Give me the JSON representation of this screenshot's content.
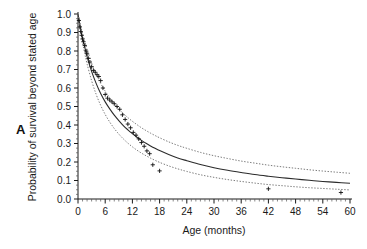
{
  "figure": {
    "panel_label": "A",
    "background_color": "#ffffff",
    "ink_color": "#1a1a1a"
  },
  "chart_data": {
    "type": "line",
    "title": "",
    "xlabel": "Age (months)",
    "ylabel": "Probability of survival beyond stated age",
    "xlim": [
      0,
      60
    ],
    "ylim": [
      0.0,
      1.0
    ],
    "grid": false,
    "legend_position": "none",
    "xticks": [
      0,
      6,
      12,
      18,
      24,
      30,
      36,
      42,
      48,
      54,
      60
    ],
    "xticklabels": [
      "0",
      "6",
      "12",
      "18",
      "24",
      "30",
      "36",
      "42",
      "48",
      "54",
      "60"
    ],
    "yticks": [
      0.0,
      0.1,
      0.2,
      0.3,
      0.4,
      0.5,
      0.6,
      0.7,
      0.8,
      0.9,
      1.0
    ],
    "yticklabels": [
      "0.0",
      "0.1",
      "0.2",
      "0.3",
      "0.4",
      "0.5",
      "0.6",
      "0.7",
      "0.8",
      "0.9",
      "1.0"
    ],
    "xtick_minor_step": 1,
    "series": [
      {
        "name": "Fitted survival function",
        "style": "solid",
        "color": "#2b2b2b",
        "x": [
          0,
          0.5,
          1,
          1.5,
          2,
          3,
          4,
          5,
          6,
          7,
          8,
          9,
          10,
          11,
          12,
          13,
          14,
          15,
          16,
          17,
          18,
          20,
          22,
          24,
          27,
          30,
          33,
          36,
          39,
          42,
          45,
          48,
          51,
          54,
          57,
          60
        ],
        "y": [
          1.0,
          0.93,
          0.87,
          0.82,
          0.77,
          0.69,
          0.625,
          0.57,
          0.525,
          0.487,
          0.453,
          0.424,
          0.397,
          0.374,
          0.353,
          0.334,
          0.317,
          0.301,
          0.287,
          0.274,
          0.262,
          0.241,
          0.222,
          0.207,
          0.186,
          0.169,
          0.155,
          0.143,
          0.132,
          0.123,
          0.115,
          0.108,
          0.101,
          0.095,
          0.09,
          0.085
        ]
      },
      {
        "name": "Upper 95% confidence limit",
        "style": "dotted",
        "color": "#6b6b6b",
        "x": [
          0,
          0.5,
          1,
          1.5,
          2,
          3,
          4,
          5,
          6,
          7,
          8,
          9,
          10,
          11,
          12,
          13,
          14,
          15,
          16,
          17,
          18,
          20,
          22,
          24,
          27,
          30,
          33,
          36,
          39,
          42,
          45,
          48,
          51,
          54,
          57,
          60
        ],
        "y": [
          1.0,
          0.945,
          0.895,
          0.85,
          0.81,
          0.735,
          0.675,
          0.625,
          0.583,
          0.547,
          0.515,
          0.487,
          0.462,
          0.44,
          0.42,
          0.402,
          0.385,
          0.37,
          0.356,
          0.343,
          0.331,
          0.309,
          0.29,
          0.274,
          0.252,
          0.234,
          0.219,
          0.205,
          0.194,
          0.183,
          0.174,
          0.166,
          0.158,
          0.151,
          0.145,
          0.139
        ]
      },
      {
        "name": "Lower 95% confidence limit",
        "style": "dotted",
        "color": "#6b6b6b",
        "x": [
          0,
          0.5,
          1,
          1.5,
          2,
          3,
          4,
          5,
          6,
          7,
          8,
          9,
          10,
          11,
          12,
          13,
          14,
          15,
          16,
          17,
          18,
          20,
          22,
          24,
          27,
          30,
          33,
          36,
          39,
          42,
          45,
          48,
          51,
          54,
          57,
          60
        ],
        "y": [
          1.0,
          0.915,
          0.845,
          0.785,
          0.73,
          0.64,
          0.566,
          0.506,
          0.457,
          0.416,
          0.381,
          0.351,
          0.325,
          0.302,
          0.282,
          0.264,
          0.248,
          0.234,
          0.221,
          0.209,
          0.198,
          0.179,
          0.163,
          0.149,
          0.131,
          0.117,
          0.105,
          0.095,
          0.086,
          0.078,
          0.072,
          0.066,
          0.061,
          0.057,
          0.053,
          0.049
        ]
      }
    ],
    "observed_points": {
      "name": "Observed survival estimates",
      "marker": "plus",
      "color": "#111111",
      "x": [
        0.2,
        0.4,
        0.6,
        0.8,
        1.0,
        1.2,
        1.5,
        1.8,
        2.0,
        2.3,
        2.6,
        3.0,
        3.4,
        3.8,
        4.2,
        4.6,
        5.0,
        5.5,
        6.0,
        6.5,
        7.0,
        7.5,
        8.0,
        8.6,
        9.2,
        9.8,
        10.4,
        11.0,
        11.6,
        12.2,
        12.8,
        13.4,
        14.0,
        14.6,
        15.2,
        15.8,
        16.5,
        18.0,
        42.0,
        58.0
      ],
      "y": [
        0.965,
        0.93,
        0.905,
        0.885,
        0.865,
        0.85,
        0.83,
        0.8,
        0.785,
        0.76,
        0.74,
        0.715,
        0.695,
        0.685,
        0.672,
        0.662,
        0.64,
        0.6,
        0.565,
        0.545,
        0.535,
        0.525,
        0.515,
        0.5,
        0.485,
        0.455,
        0.43,
        0.405,
        0.385,
        0.36,
        0.345,
        0.325,
        0.305,
        0.285,
        0.26,
        0.245,
        0.185,
        0.152,
        0.055,
        0.035
      ]
    }
  }
}
